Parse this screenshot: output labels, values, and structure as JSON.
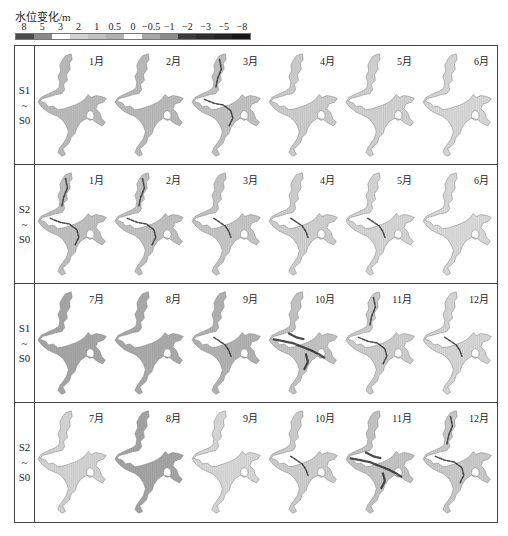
{
  "legend": {
    "title": "水位变化/m",
    "ticks": [
      "8",
      "5",
      "3",
      "2",
      "1",
      "0.5",
      "0",
      "−0.5",
      "−1",
      "−2",
      "−3",
      "−5",
      "−8"
    ],
    "segment_colors": [
      "#4a4a4a",
      "#8a8a8a",
      "#ffffff",
      "#d2d2d2",
      "#c0c0c0",
      "#b0b0b0",
      "#ffffff",
      "#a8a8a8",
      "#8c8c8c",
      "#3a3a3a",
      "#2e2e2e",
      "#242424",
      "#181818"
    ]
  },
  "rows": [
    {
      "label_top": "S1",
      "label_mid": "~",
      "label_bot": "S0",
      "cells": [
        {
          "month": "1月",
          "fill": "#bdbdbd",
          "dark": 0
        },
        {
          "month": "2月",
          "fill": "#bcbcbc",
          "dark": 0
        },
        {
          "month": "3月",
          "fill": "#c4c4c4",
          "dark": 2
        },
        {
          "month": "4月",
          "fill": "#cfcfcf",
          "dark": 0
        },
        {
          "month": "5月",
          "fill": "#d4d4d4",
          "dark": 0
        },
        {
          "month": "6月",
          "fill": "#dadada",
          "dark": 0
        }
      ]
    },
    {
      "label_top": "S2",
      "label_mid": "~",
      "label_bot": "S0",
      "cells": [
        {
          "month": "1月",
          "fill": "#c2c2c2",
          "dark": 2
        },
        {
          "month": "2月",
          "fill": "#c4c4c4",
          "dark": 2
        },
        {
          "month": "3月",
          "fill": "#c8c8c8",
          "dark": 1
        },
        {
          "month": "4月",
          "fill": "#d2d2d2",
          "dark": 1
        },
        {
          "month": "5月",
          "fill": "#d8d8d8",
          "dark": 1
        },
        {
          "month": "6月",
          "fill": "#dcdcdc",
          "dark": 0
        }
      ]
    },
    {
      "label_top": "S1",
      "label_mid": "~",
      "label_bot": "S0",
      "cells": [
        {
          "month": "7月",
          "fill": "#a8a8a8",
          "dark": 0
        },
        {
          "month": "8月",
          "fill": "#acacac",
          "dark": 0
        },
        {
          "month": "9月",
          "fill": "#b4b4b4",
          "dark": 1
        },
        {
          "month": "10月",
          "fill": "#c6c6c6",
          "dark": 3
        },
        {
          "month": "11月",
          "fill": "#d0d0d0",
          "dark": 2
        },
        {
          "month": "12月",
          "fill": "#d8d8d8",
          "dark": 1
        }
      ]
    },
    {
      "label_top": "S2",
      "label_mid": "~",
      "label_bot": "S0",
      "cells": [
        {
          "month": "7月",
          "fill": "#d6d6d6",
          "dark": 0
        },
        {
          "month": "8月",
          "fill": "#a6a6a6",
          "dark": 0
        },
        {
          "month": "9月",
          "fill": "#dadada",
          "dark": 0
        },
        {
          "month": "10月",
          "fill": "#d0d0d0",
          "dark": 1
        },
        {
          "month": "11月",
          "fill": "#c6c6c6",
          "dark": 3
        },
        {
          "month": "12月",
          "fill": "#cccccc",
          "dark": 2
        }
      ]
    }
  ]
}
